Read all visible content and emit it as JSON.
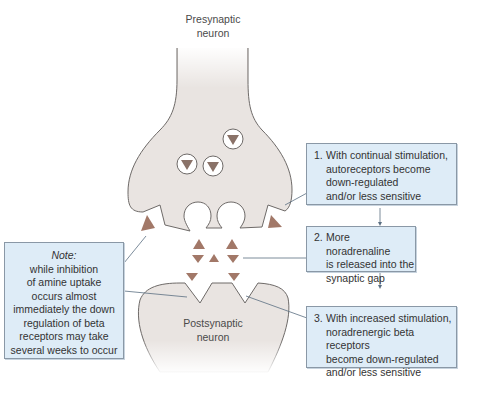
{
  "colors": {
    "neuron_fill": "#e9e4e1",
    "neuron_outline": "#6e6a68",
    "transmitter": "#a27868",
    "box_fill": "#deecf7",
    "box_border": "#8a98a6",
    "connector": "#5b6f82"
  },
  "labels": {
    "presynaptic": [
      "Presynaptic",
      "neuron"
    ],
    "postsynaptic": [
      "Postsynaptic",
      "neuron"
    ]
  },
  "boxes": [
    {
      "number": "1.",
      "lines": [
        "With continual stimulation,",
        "autoreceptors become",
        "down-regulated",
        "and/or less sensitive"
      ]
    },
    {
      "number": "2.",
      "lines": [
        "More noradrenaline",
        "is released into the",
        "synaptic gap"
      ]
    },
    {
      "number": "3.",
      "lines": [
        "With increased stimulation,",
        "noradrenergic beta receptors",
        "become down-regulated",
        "and/or less sensitive"
      ]
    }
  ],
  "note": {
    "title": "Note:",
    "lines": [
      "while inhibition",
      "of amine uptake",
      "occurs almost",
      "immediately the down",
      "regulation of beta",
      "receptors may take",
      "several weeks to occur"
    ]
  },
  "icons": {
    "vesicle": "vesicle-with-transmitter-icon",
    "transmitter": "noradrenaline-molecule-icon",
    "empty_vesicle": "empty-vesicle-icon"
  }
}
